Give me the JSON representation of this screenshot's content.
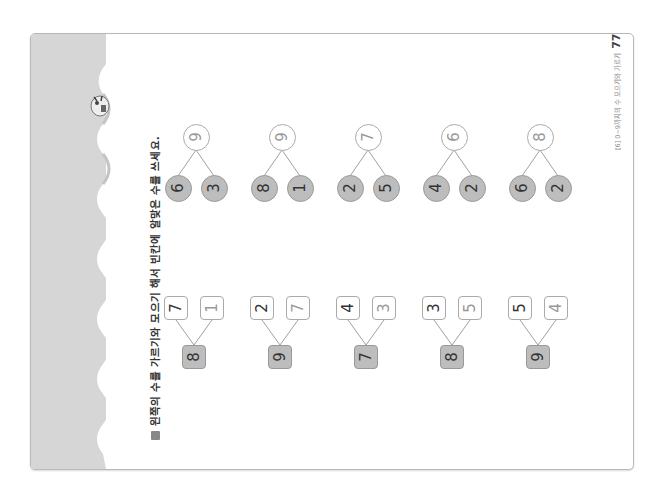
{
  "page": {
    "instruction_marker": "■",
    "instruction": "왼쪽의 수를 가르기와 모으기 해서 빈칸에 알맞은 수를 쓰세요.",
    "footer_chapter": "[6] 0~9까지의 수 모으기와 가르기",
    "page_number": "77",
    "colors": {
      "band": "#d6d6d6",
      "filled": "#bdbdbd",
      "border": "#aaaaaa"
    }
  },
  "splitting": [
    {
      "whole": "9",
      "parts": [
        "6",
        "3"
      ]
    },
    {
      "whole": "9",
      "parts": [
        "8",
        "1"
      ]
    },
    {
      "whole": "7",
      "parts": [
        "2",
        "5"
      ]
    },
    {
      "whole": "6",
      "parts": [
        "4",
        "2"
      ]
    },
    {
      "whole": "8",
      "parts": [
        "6",
        "2"
      ]
    }
  ],
  "combining": [
    {
      "parts": [
        "7",
        "1"
      ],
      "whole": "8"
    },
    {
      "parts": [
        "2",
        "7"
      ],
      "whole": "9"
    },
    {
      "parts": [
        "4",
        "3"
      ],
      "whole": "7"
    },
    {
      "parts": [
        "3",
        "5"
      ],
      "whole": "8"
    },
    {
      "parts": [
        "5",
        "4"
      ],
      "whole": "9"
    }
  ]
}
